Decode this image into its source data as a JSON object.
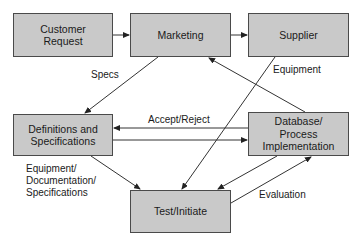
{
  "nodes": {
    "customer_request": {
      "label": "Customer\nRequest",
      "line1": "Customer",
      "line2": "Request"
    },
    "marketing": {
      "label": "Marketing"
    },
    "supplier": {
      "label": "Supplier"
    },
    "definitions": {
      "line1": "Definitions and",
      "line2": "Specifications"
    },
    "database": {
      "line1": "Database/",
      "line2": "Process",
      "line3": "Implementation"
    },
    "test": {
      "label": "Test/Initiate"
    }
  },
  "edges": {
    "specs": "Specs",
    "equipment": "Equipment",
    "accept_reject": "Accept/Reject",
    "equip_doc_spec_1": "Equipment/",
    "equip_doc_spec_2": "Documentation/",
    "equip_doc_spec_3": "Specifications",
    "evaluation": "Evaluation"
  },
  "colors": {
    "box_fill": "#c9c9c9",
    "line": "#333333"
  }
}
